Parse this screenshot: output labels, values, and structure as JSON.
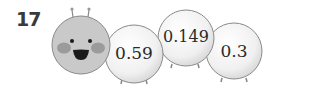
{
  "problem": {
    "number": "17"
  },
  "caterpillar": {
    "head": {
      "face": "smiling-face"
    },
    "segments": [
      {
        "value": "0.59"
      },
      {
        "value": "0.149"
      },
      {
        "value": "0.3"
      }
    ]
  },
  "colors": {
    "head_fill": "#c8c8c8",
    "cheek": "#9a9a9a",
    "ball_fill": "#f2f2f2",
    "outline": "#8a8a8a"
  }
}
